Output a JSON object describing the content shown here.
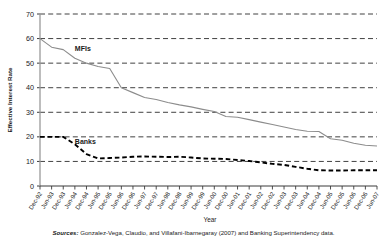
{
  "figure": {
    "source_prefix": "Sources:",
    "source_text": " Gonzalez-Vega, Claudio, and Villafani-Ibarnegaray (2007) and Banking Superintendency data."
  },
  "chart_data": {
    "type": "line",
    "title": "",
    "xlabel": "Year",
    "ylabel": "Effective Interest Rate",
    "ylim": [
      0,
      70
    ],
    "yticks": [
      0,
      10,
      20,
      30,
      40,
      50,
      60,
      70
    ],
    "grid": true,
    "legend_position": "inline-annotations",
    "annotations": [
      {
        "text": "MFIs",
        "x": "Jun-94",
        "y": 55
      },
      {
        "text": "Banks",
        "x": "Jun-94",
        "y": 17
      }
    ],
    "categories": [
      "Dec-92",
      "Jun-93",
      "Dec-93",
      "Jun-94",
      "Dec-94",
      "Jun-95",
      "Dec-95",
      "Jun-96",
      "Dec-96",
      "Jun-97",
      "Dec-97",
      "Jun-98",
      "Dec-98",
      "Jun-99",
      "Dec-99",
      "Jun-00",
      "Dec-00",
      "Jun-01",
      "Dec-01",
      "Jun-02",
      "Dec-02",
      "Jun-03",
      "Dec-03",
      "Jun-04",
      "Dec-04",
      "Jun-05",
      "Dec-05",
      "Jun-06",
      "Dec-06",
      "Jun-07"
    ],
    "series": [
      {
        "name": "MFIs",
        "style": "solid",
        "color": "#8c8c8c",
        "values": [
          60.0,
          56.5,
          55.5,
          52.0,
          50.0,
          48.6,
          47.8,
          40.0,
          38.0,
          36.0,
          35.2,
          34.0,
          33.0,
          32.2,
          31.2,
          30.3,
          28.3,
          28.0,
          27.0,
          26.0,
          25.0,
          24.0,
          23.0,
          22.3,
          22.2,
          19.2,
          18.6,
          17.4,
          16.6,
          16.3
        ]
      },
      {
        "name": "Banks",
        "style": "dashed",
        "color": "#000000",
        "values": [
          20.0,
          20.0,
          20.0,
          17.0,
          13.0,
          11.2,
          11.4,
          11.6,
          11.9,
          12.0,
          11.9,
          11.8,
          11.9,
          11.6,
          11.2,
          11.1,
          11.0,
          10.6,
          10.2,
          9.6,
          9.0,
          8.6,
          7.8,
          7.0,
          6.4,
          6.3,
          6.3,
          6.4,
          6.4,
          6.4
        ]
      }
    ]
  }
}
